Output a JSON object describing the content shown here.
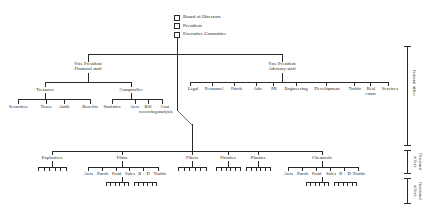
{
  "chart_title": "Multidivisional organization chart",
  "top_boxes": [
    {
      "label": "Board of Directors"
    },
    {
      "label": "President"
    },
    {
      "label": "Executive Committee"
    }
  ],
  "vice_presidents": [
    {
      "line1": "Vice President",
      "line2": "Financial staff"
    },
    {
      "line1": "Vice President",
      "line2": "Advisory staff"
    }
  ],
  "financial_heads": [
    "Treasurer",
    "Comptroller"
  ],
  "treasurer_units": [
    "Securities",
    "Taxes",
    "Audit",
    "Benefits"
  ],
  "comptroller_units": [
    {
      "line1": "Statistics",
      "line2": ""
    },
    {
      "line1": "Acct.",
      "line2": ""
    },
    {
      "line1": "Bill",
      "line2": "receiving"
    },
    {
      "line1": "Cost",
      "line2": "analysis"
    }
  ],
  "advisory_units": [
    {
      "line1": "Legal",
      "line2": ""
    },
    {
      "line1": "Personnel",
      "line2": ""
    },
    {
      "line1": "Purch.",
      "line2": ""
    },
    {
      "line1": "Adv.",
      "line2": ""
    },
    {
      "line1": "PR",
      "line2": ""
    },
    {
      "line1": "Engineering",
      "line2": ""
    },
    {
      "line1": "Development",
      "line2": ""
    },
    {
      "line1": "Traffic",
      "line2": ""
    },
    {
      "line1": "Real",
      "line2": "estate"
    },
    {
      "line1": "Services",
      "line2": ""
    }
  ],
  "divisions": [
    "Explosives",
    "Films",
    "Fibers",
    "Finishes",
    "Plastics",
    "Chemicals"
  ],
  "functional_units": [
    "Acct.",
    "Purch.",
    "Prod.",
    "Sales",
    "R + D",
    "Traffic"
  ],
  "side_brackets": [
    {
      "label": "General office"
    },
    {
      "label": "Divisional offices"
    },
    {
      "label": "Functional offices"
    }
  ],
  "colors": {
    "line": "#2a2a2a",
    "text": "#1a1a1a",
    "background": "#ffffff"
  }
}
